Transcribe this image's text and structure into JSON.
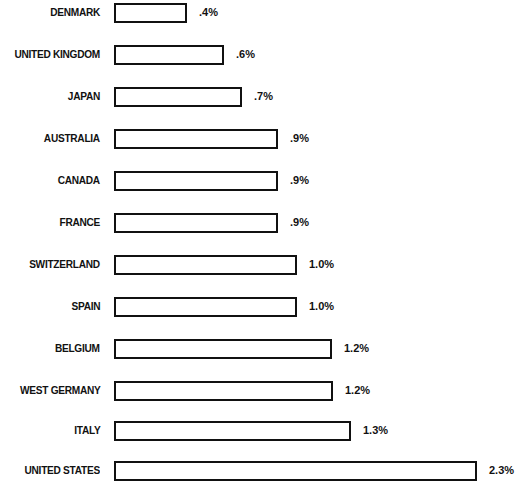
{
  "chart_data": {
    "type": "bar",
    "orientation": "horizontal",
    "title": "",
    "xlabel": "",
    "ylabel": "",
    "grid": false,
    "legend": null,
    "categories": [
      "DENMARK",
      "UNITED KINGDOM",
      "JAPAN",
      "AUSTRALIA",
      "CANADA",
      "FRANCE",
      "SWITZERLAND",
      "SPAIN",
      "BELGIUM",
      "WEST GERMANY",
      "ITALY",
      "UNITED STATES"
    ],
    "values": [
      0.4,
      0.6,
      0.7,
      0.9,
      0.9,
      0.9,
      1.0,
      1.0,
      1.2,
      1.2,
      1.3,
      2.3
    ],
    "value_labels": [
      ".4%",
      ".6%",
      ".7%",
      ".9%",
      ".9%",
      ".9%",
      "1.0%",
      "1.0%",
      "1.2%",
      "1.2%",
      "1.3%",
      "2.3%"
    ],
    "unit": "%",
    "xlim": [
      0,
      2.4
    ]
  },
  "rows": [
    {
      "label": "DENMARK",
      "value_label": ".4%"
    },
    {
      "label": "UNITED KINGDOM",
      "value_label": ".6%"
    },
    {
      "label": "JAPAN",
      "value_label": ".7%"
    },
    {
      "label": "AUSTRALIA",
      "value_label": ".9%"
    },
    {
      "label": "CANADA",
      "value_label": ".9%"
    },
    {
      "label": "FRANCE",
      "value_label": ".9%"
    },
    {
      "label": "SWITZERLAND",
      "value_label": "1.0%"
    },
    {
      "label": "SPAIN",
      "value_label": "1.0%"
    },
    {
      "label": "BELGIUM",
      "value_label": "1.2%"
    },
    {
      "label": "WEST GERMANY",
      "value_label": "1.2%"
    },
    {
      "label": "ITALY",
      "value_label": "1.3%"
    },
    {
      "label": "UNITED STATES",
      "value_label": "2.3%"
    }
  ],
  "bar_widths_px": [
    73,
    110,
    128,
    164,
    164,
    164,
    183,
    183,
    218,
    219,
    237,
    363
  ],
  "row_tops_px": [
    2,
    44,
    86,
    128,
    170,
    212,
    254,
    296,
    338,
    380,
    420,
    460
  ]
}
